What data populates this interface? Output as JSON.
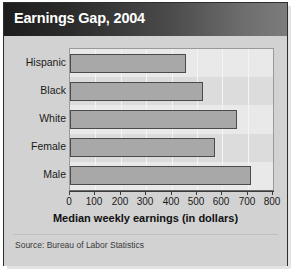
{
  "title": "Earnings Gap, 2004",
  "source_note": "Source: Bureau of Labor Statistics",
  "colors": {
    "bar_fill": "#a8a8a8",
    "bar_border": "#4b4b4b",
    "plot_background": "#dcdcdc",
    "row_band": "#e9e9e9",
    "gridline": "#f4f4f4",
    "panel_background": "#d2d2d2",
    "title_text": "#ffffff",
    "title_bar_dark": "#1d1d1d",
    "title_bar_light": "#7c7c7c"
  },
  "chart_data": {
    "type": "bar",
    "orientation": "horizontal",
    "title": "Earnings Gap, 2004",
    "categories": [
      "Hispanic",
      "Black",
      "White",
      "Female",
      "Male"
    ],
    "values": [
      456,
      525,
      657,
      573,
      713
    ],
    "xlabel": "Median weekly earnings (in dollars)",
    "ylabel": "",
    "xlim": [
      0,
      800
    ],
    "xticks": [
      0,
      100,
      200,
      300,
      400,
      500,
      600,
      700,
      800
    ],
    "xticklabels": [
      "0",
      "100",
      "200",
      "300",
      "400",
      "500",
      "600",
      "700",
      "800"
    ],
    "grid": "vertical",
    "legend": "none",
    "series": [
      {
        "name": "Median weekly earnings",
        "values": [
          456,
          525,
          657,
          573,
          713
        ]
      }
    ],
    "annotations": [
      "Source: Bureau of Labor Statistics"
    ]
  }
}
